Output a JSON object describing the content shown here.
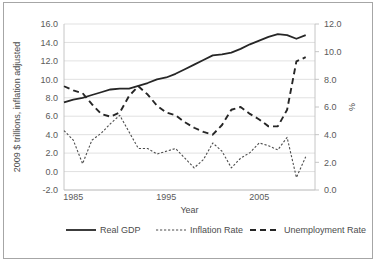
{
  "chart_data": {
    "type": "line",
    "title": "",
    "xlabel": "Year",
    "ylabel": "2009 $ trillions, inflation adjusted",
    "y2label": "%",
    "grid": true,
    "legend_position": "bottom",
    "xlim": [
      1984,
      2011
    ],
    "xticks": [
      "1985",
      "1995",
      "2005"
    ],
    "xtick_values": [
      1985,
      1995,
      2005
    ],
    "ylim": [
      -2.0,
      16.0
    ],
    "yticks": [
      "-2.0",
      "0.0",
      "2.0",
      "4.0",
      "6.0",
      "8.0",
      "10.0",
      "12.0",
      "14.0",
      "16.0"
    ],
    "ytick_values": [
      -2.0,
      0.0,
      2.0,
      4.0,
      6.0,
      8.0,
      10.0,
      12.0,
      14.0,
      16.0
    ],
    "y2lim": [
      0.0,
      12.0
    ],
    "y2ticks": [
      "0.0",
      "2.0",
      "4.0",
      "6.0",
      "8.0",
      "10.0",
      "12.0"
    ],
    "y2tick_values": [
      0.0,
      2.0,
      4.0,
      6.0,
      8.0,
      10.0,
      12.0
    ],
    "x": [
      1984,
      1985,
      1986,
      1987,
      1988,
      1989,
      1990,
      1991,
      1992,
      1993,
      1994,
      1995,
      1996,
      1997,
      1998,
      1999,
      2000,
      2001,
      2002,
      2003,
      2004,
      2005,
      2006,
      2007,
      2008,
      2009,
      2010
    ],
    "series": [
      {
        "name": "Real GDP",
        "axis": "left",
        "style": "solid",
        "color": "#262626",
        "values": [
          7.5,
          7.8,
          8.0,
          8.3,
          8.6,
          8.9,
          9.0,
          9.0,
          9.3,
          9.6,
          10.0,
          10.2,
          10.6,
          11.1,
          11.6,
          12.1,
          12.6,
          12.7,
          12.9,
          13.3,
          13.8,
          14.2,
          14.6,
          14.9,
          14.8,
          14.4,
          14.8
        ],
        "units": "2009 $ trillions"
      },
      {
        "name": "Inflation Rate",
        "axis": "right",
        "style": "dotted",
        "color": "#4d4d4d",
        "values": [
          4.3,
          3.6,
          1.9,
          3.6,
          4.1,
          4.8,
          5.4,
          4.2,
          3.0,
          3.0,
          2.6,
          2.8,
          3.0,
          2.3,
          1.6,
          2.2,
          3.4,
          2.8,
          1.6,
          2.3,
          2.7,
          3.4,
          3.2,
          2.9,
          3.8,
          0.9,
          2.4
        ],
        "units": "%"
      },
      {
        "name": "Unemployment Rate",
        "axis": "right",
        "style": "dashed",
        "color": "#262626",
        "values": [
          7.5,
          7.2,
          7.0,
          6.2,
          5.5,
          5.3,
          5.6,
          6.8,
          7.5,
          6.9,
          6.1,
          5.6,
          5.4,
          4.9,
          4.5,
          4.2,
          4.0,
          4.7,
          5.8,
          6.0,
          5.5,
          5.1,
          4.6,
          4.6,
          5.8,
          9.3,
          9.6
        ],
        "units": "%"
      }
    ]
  },
  "legend": {
    "items": [
      {
        "label": "Real GDP"
      },
      {
        "label": "Inflation Rate"
      },
      {
        "label": "Unemployment Rate"
      }
    ]
  }
}
